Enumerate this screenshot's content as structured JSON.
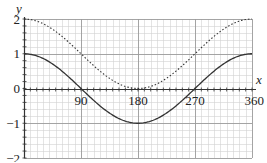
{
  "chart_data": {
    "type": "line",
    "title": "",
    "xlabel": "x",
    "ylabel": "y",
    "xlim": [
      0,
      360
    ],
    "ylim": [
      -2,
      2
    ],
    "x_ticks": [
      90,
      180,
      270,
      360
    ],
    "x_tick_labels": [
      "90",
      "180",
      "270",
      "360"
    ],
    "y_ticks": [
      -2,
      -1,
      0,
      1,
      2
    ],
    "y_tick_labels": [
      "−2",
      "−1",
      "0",
      "1",
      "2"
    ],
    "grid": {
      "major_x_step": 90,
      "minor_x_step": 10,
      "major_y_step": 1,
      "minor_y_step": 0.2
    },
    "legend": null,
    "x": [
      0,
      30,
      60,
      90,
      120,
      150,
      180,
      210,
      240,
      270,
      300,
      330,
      360
    ],
    "series": [
      {
        "name": "y = cos x",
        "style": "solid",
        "values": [
          1,
          0.87,
          0.5,
          0,
          -0.5,
          -0.87,
          -1,
          -0.87,
          -0.5,
          0,
          0.5,
          0.87,
          1
        ]
      },
      {
        "name": "y = cos x + 1",
        "style": "dotted",
        "values": [
          2,
          1.87,
          1.5,
          1,
          0.5,
          0.13,
          0,
          0.13,
          0.5,
          1,
          1.5,
          1.87,
          2
        ]
      }
    ]
  },
  "colors": {
    "curve": "#333333",
    "axis": "#333333",
    "grid_major": "#9a9a9a",
    "grid_minor": "#d2d2d2",
    "background": "#ffffff"
  }
}
